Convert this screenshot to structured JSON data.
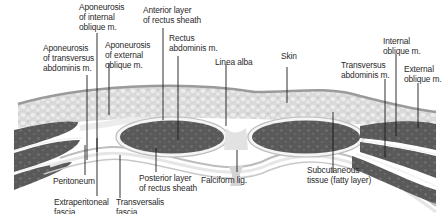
{
  "figure": {
    "type": "anatomical cross-section",
    "colors": {
      "skin": "#9a9a9a",
      "subcutaneous": "#d6d6d6",
      "muscle": "#5e5e5e",
      "fascia_light": "#ececec",
      "fascia_mid": "#bdbdbd",
      "leader": "#1a1a1a",
      "text": "#2a2a2a"
    }
  },
  "labels": {
    "top": [
      {
        "id": "aponeurosis-internal-oblique",
        "text": "Aponeurosis\nof internal\noblique m."
      },
      {
        "id": "anterior-layer-rectus-sheath",
        "text": "Anterior layer\nof rectus sheath"
      },
      {
        "id": "aponeurosis-transversus",
        "text": "Aponeurosis\nof transversus\nabdominis m."
      },
      {
        "id": "aponeurosis-external-oblique",
        "text": "Aponeurosis\nof external\noblique m."
      },
      {
        "id": "rectus-abdominis",
        "text": "Rectus\nabdominis m."
      },
      {
        "id": "linea-alba",
        "text": "Linea alba"
      },
      {
        "id": "skin",
        "text": "Skin"
      },
      {
        "id": "internal-oblique",
        "text": "Internal\noblique m."
      },
      {
        "id": "transversus-abdominis",
        "text": "Transversus\nabdominis m."
      },
      {
        "id": "external-oblique",
        "text": "External\noblique m."
      }
    ],
    "bottom": [
      {
        "id": "peritoneum",
        "text": "Peritoneum"
      },
      {
        "id": "posterior-layer-rectus-sheath",
        "text": "Posterior layer\nof rectus sheath"
      },
      {
        "id": "falciform-lig",
        "text": "Falciform lig."
      },
      {
        "id": "subcutaneous-tissue",
        "text": "Subcutaneous\ntissue (fatty layer)"
      },
      {
        "id": "extraperitoneal-fascia",
        "text": "Extraperitoneal\nfascia"
      },
      {
        "id": "transversalis-fascia",
        "text": "Transversalis\nfascia"
      }
    ]
  }
}
